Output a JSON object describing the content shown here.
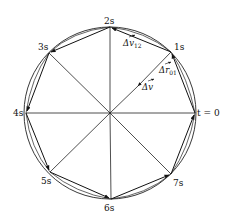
{
  "diagram": {
    "type": "circular-motion-velocity-vectors",
    "center": {
      "x": 110,
      "y": 113
    },
    "radius": 86,
    "stroke_color": "#222222",
    "points": [
      {
        "label": "t = 0",
        "angle_deg": 0
      },
      {
        "label": "1s",
        "angle_deg": 45
      },
      {
        "label": "2s",
        "angle_deg": 90
      },
      {
        "label": "3s",
        "angle_deg": 135
      },
      {
        "label": "4s",
        "angle_deg": 180
      },
      {
        "label": "5s",
        "angle_deg": 225
      },
      {
        "label": "6s",
        "angle_deg": 270
      },
      {
        "label": "7s",
        "angle_deg": 315
      }
    ],
    "labels": {
      "t0": "t = 0",
      "p1": "1s",
      "p2": "2s",
      "p3": "3s",
      "p4": "4s",
      "p5": "5s",
      "p6": "6s",
      "p7": "7s",
      "delta_v12": "Δv",
      "delta_v12_sub": "12",
      "delta_r01": "Δr",
      "delta_r01_sub": "01",
      "delta_v": "Δv"
    }
  }
}
